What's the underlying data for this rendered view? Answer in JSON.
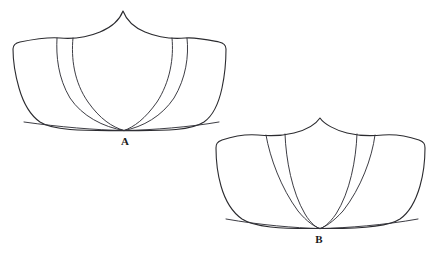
{
  "figure": {
    "type": "line-drawing",
    "background_color": "#ffffff",
    "line_color": "#2b2b2f",
    "label_color": "#1a1a1a",
    "panels": [
      {
        "id": "A",
        "label": "A",
        "label_x": 125,
        "label_y": 143,
        "outline_points": "peak(123,11) left-shoulder(60,37) left-corner(14,45) left-bottom(28,108) bottom-center(124,130) right-bottom(218,108) right-corner(225,45) right-shoulder(188,37)",
        "seam_lines": 4,
        "seam_starts_x": [
          57,
          73,
          172,
          186
        ],
        "seam_converge_x": 124,
        "seam_converge_y": 129
      },
      {
        "id": "B",
        "label": "B",
        "label_x": 318,
        "label_y": 240,
        "outline_points": "peak(320,118) left-shoulder(260,134) left-corner(216,148) left-bottom(224,206) bottom-center(320,228) right-bottom(416,206) right-corner(426,148) right-shoulder(382,134)",
        "seam_lines": 4,
        "seam_starts_x": [
          267,
          285,
          357,
          375
        ],
        "seam_converge_x": 320,
        "seam_converge_y": 228
      }
    ]
  }
}
